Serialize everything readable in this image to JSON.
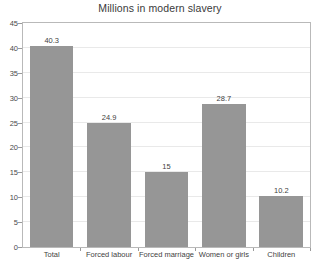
{
  "chart_data": {
    "type": "bar",
    "title": "Millions in modern slavery",
    "xlabel": "",
    "ylabel": "",
    "categories": [
      "Total",
      "Forced labour",
      "Forced marriage",
      "Women or girls",
      "Children"
    ],
    "values": [
      40.3,
      24.9,
      15,
      28.7,
      10.2
    ],
    "value_labels": [
      "40.3",
      "24.9",
      "15",
      "28.7",
      "10.2"
    ],
    "ylim": [
      0,
      45
    ],
    "yticks": [
      0,
      5,
      10,
      15,
      20,
      25,
      30,
      35,
      40,
      45
    ],
    "ytick_labels": [
      "0",
      "5",
      "10",
      "15",
      "20",
      "25",
      "30",
      "35",
      "40",
      "45"
    ],
    "grid": true,
    "legend": false,
    "bar_color": "#969696",
    "frame_color": "#b9b9b9",
    "gridline_color": "#e9e9e9",
    "background_color": "#ffffff",
    "text_color": "#3f3f3f"
  }
}
